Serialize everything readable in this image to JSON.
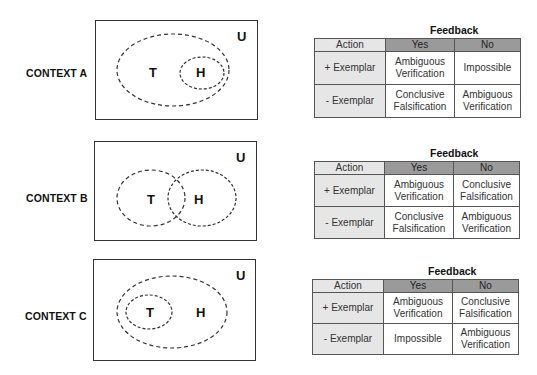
{
  "contexts": [
    {
      "label": "CONTEXT A",
      "universe_label": "U",
      "sets": {
        "T": "T",
        "H": "H"
      },
      "relation": "H subset of T",
      "table": {
        "title": "Feedback",
        "headers": [
          "Action",
          "Yes",
          "No"
        ],
        "rows": [
          {
            "action": "+ Exemplar",
            "yes": "Ambiguous Verification",
            "no": "Impossible"
          },
          {
            "action": "- Exemplar",
            "yes": "Conclusive Falsification",
            "no": "Ambiguous Verification"
          }
        ]
      }
    },
    {
      "label": "CONTEXT B",
      "universe_label": "U",
      "sets": {
        "T": "T",
        "H": "H"
      },
      "relation": "T and H overlap",
      "table": {
        "title": "Feedback",
        "headers": [
          "Action",
          "Yes",
          "No"
        ],
        "rows": [
          {
            "action": "+ Exemplar",
            "yes": "Ambiguous Verification",
            "no": "Conclusive Falsification"
          },
          {
            "action": "- Exemplar",
            "yes": "Conclusive Falsification",
            "no": "Ambiguous Verification"
          }
        ]
      }
    },
    {
      "label": "CONTEXT C",
      "universe_label": "U",
      "sets": {
        "T": "T",
        "H": "H"
      },
      "relation": "T subset of H",
      "table": {
        "title": "Feedback",
        "headers": [
          "Action",
          "Yes",
          "No"
        ],
        "rows": [
          {
            "action": "+ Exemplar",
            "yes": "Ambiguous Verification",
            "no": "Conclusive Falsification"
          },
          {
            "action": "- Exemplar",
            "yes": "Impossible",
            "no": "Ambiguous Verification"
          }
        ]
      }
    }
  ]
}
